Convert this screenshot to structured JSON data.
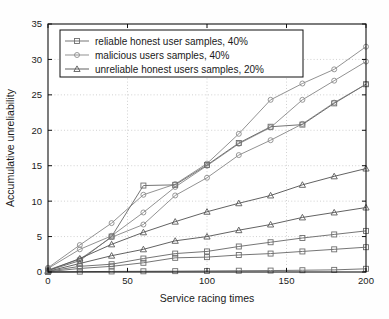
{
  "chart_data": {
    "type": "line",
    "title": "",
    "xlabel": "Service racing times",
    "ylabel": "Accumulative unreliability",
    "xlim": [
      0,
      200
    ],
    "ylim": [
      0,
      35
    ],
    "xticks": [
      0,
      50,
      100,
      150,
      200
    ],
    "yticks": [
      0,
      5,
      10,
      15,
      20,
      25,
      30,
      35
    ],
    "xticklabels": [
      "0",
      "50",
      "100",
      "150",
      "200"
    ],
    "yticklabels": [
      "0",
      "5",
      "10",
      "15",
      "20",
      "25",
      "30",
      "35"
    ],
    "grid": true,
    "grid_style": "dotted",
    "legend_position": "upper left inside",
    "x": [
      0,
      20,
      40,
      60,
      80,
      100,
      120,
      140,
      160,
      180,
      200
    ],
    "legend": [
      {
        "label": "reliable honest user samples, 40%",
        "marker": "square"
      },
      {
        "label": "malicious users samples, 40%",
        "marker": "circle"
      },
      {
        "label": "unreliable honest users samples, 20%",
        "marker": "triangle"
      }
    ],
    "series": [
      {
        "name": "malicious-high",
        "marker": "circle",
        "color": "#8c8c8c",
        "values": [
          0.6,
          3.8,
          6.9,
          10.9,
          12.4,
          15.3,
          19.5,
          24.3,
          26.6,
          28.6,
          31.8
        ]
      },
      {
        "name": "malicious-mid",
        "marker": "circle",
        "color": "#8c8c8c",
        "values": [
          0.5,
          3.2,
          5.1,
          8.4,
          12.0,
          15.0,
          18.1,
          20.4,
          24.3,
          27.0,
          29.7
        ]
      },
      {
        "name": "malicious-low",
        "marker": "circle",
        "color": "#8c8c8c",
        "values": [
          0.3,
          1.8,
          4.9,
          6.7,
          10.8,
          13.3,
          16.5,
          18.6,
          20.9,
          23.9,
          26.5
        ]
      },
      {
        "name": "reliable-top",
        "marker": "square",
        "color": "#6e6e6e",
        "values": [
          0.2,
          1.6,
          5.0,
          12.2,
          12.3,
          15.1,
          18.2,
          20.5,
          20.8,
          23.8,
          26.5
        ]
      },
      {
        "name": "unreliable-high",
        "marker": "triangle",
        "color": "#5a5a5a",
        "values": [
          0.2,
          1.9,
          3.9,
          5.6,
          7.1,
          8.5,
          9.7,
          10.8,
          12.3,
          13.5,
          14.6
        ]
      },
      {
        "name": "unreliable-mid",
        "marker": "triangle",
        "color": "#5a5a5a",
        "values": [
          0.1,
          1.2,
          2.3,
          3.2,
          4.4,
          5.0,
          5.9,
          6.7,
          7.7,
          8.4,
          9.1
        ]
      },
      {
        "name": "reliable-mid",
        "marker": "square",
        "color": "#6e6e6e",
        "values": [
          0.1,
          0.8,
          1.1,
          1.9,
          2.6,
          2.9,
          3.6,
          4.2,
          4.8,
          5.3,
          5.8
        ]
      },
      {
        "name": "reliable-low",
        "marker": "square",
        "color": "#6e6e6e",
        "values": [
          0.05,
          0.5,
          0.8,
          1.3,
          2.0,
          2.1,
          2.4,
          2.6,
          2.9,
          3.2,
          3.5
        ]
      },
      {
        "name": "reliable-flat",
        "marker": "square",
        "color": "#6e6e6e",
        "values": [
          0.0,
          0.05,
          0.08,
          0.1,
          0.12,
          0.15,
          0.18,
          0.2,
          0.25,
          0.3,
          0.45
        ]
      }
    ]
  }
}
